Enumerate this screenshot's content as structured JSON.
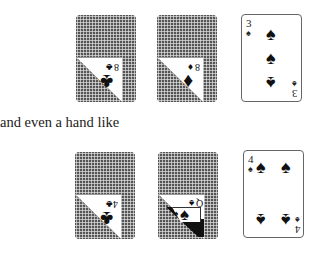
{
  "caption": "and even a hand like",
  "rows": [
    {
      "cards": [
        {
          "type": "peeled",
          "rank": "8",
          "suit": "♣",
          "suit_name": "clubs"
        },
        {
          "type": "peeled",
          "rank": "8",
          "suit": "♦",
          "suit_name": "diamonds"
        },
        {
          "type": "face",
          "rank": "3",
          "suit": "♠",
          "suit_name": "spades"
        }
      ]
    },
    {
      "cards": [
        {
          "type": "peeled",
          "rank": "4",
          "suit": "♣",
          "suit_name": "clubs"
        },
        {
          "type": "peeled",
          "rank": "Q",
          "suit": "♠",
          "suit_name": "spades"
        },
        {
          "type": "face",
          "rank": "4",
          "suit": "♠",
          "suit_name": "spades"
        }
      ]
    }
  ]
}
